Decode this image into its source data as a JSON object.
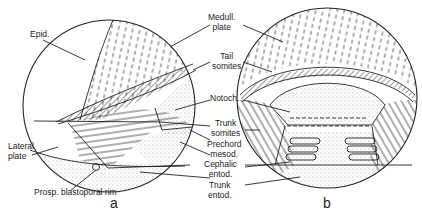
{
  "figure": {
    "panels": [
      {
        "id": "a",
        "label": "a"
      },
      {
        "id": "b",
        "label": "b"
      }
    ],
    "labels": {
      "epid": "Epid.",
      "medull_plate_1": "Medull.",
      "medull_plate_2": "plate",
      "tail_somites_1": "Tail",
      "tail_somites_2": "somites",
      "notoch": "Notoch.",
      "trunk_somites_1": "Trunk",
      "trunk_somites_2": "somites",
      "prechord_mesod_1": "Prechord",
      "prechord_mesod_2": "mesod.",
      "cephalic_entod_1": "Cephalic",
      "cephalic_entod_2": "entod.",
      "trunk_entod_1": "Trunk",
      "trunk_entod_2": "entod.",
      "lateral_plate_1": "Lateral",
      "lateral_plate_2": "plate",
      "blastoporal_rim": "Prosp. blastoporal rim"
    },
    "colors": {
      "ink": "#222222",
      "background": "#ffffff"
    }
  }
}
